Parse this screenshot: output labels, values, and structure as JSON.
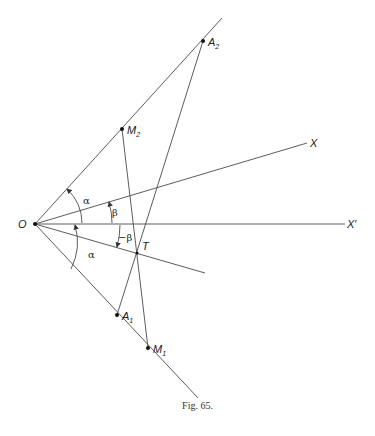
{
  "figure": {
    "caption": "Fig. 65.",
    "points": {
      "O": {
        "label": "O",
        "x": 35,
        "y": 224
      },
      "A2": {
        "label": "A",
        "sub": "2",
        "x": 203,
        "y": 41
      },
      "M2": {
        "label": "M",
        "sub": "2",
        "x": 122,
        "y": 129
      },
      "A1": {
        "label": "A",
        "sub": "1",
        "x": 117,
        "y": 315
      },
      "M1": {
        "label": "M",
        "sub": "1",
        "x": 148,
        "y": 348
      },
      "T": {
        "label": "T",
        "x": 137,
        "y": 253
      }
    },
    "rays": {
      "X": {
        "label": "X"
      },
      "X_prime": {
        "label": "X′"
      }
    },
    "angles": {
      "alpha_upper": "α",
      "beta": "β",
      "neg_beta": "−β",
      "alpha_lower": "α"
    }
  }
}
